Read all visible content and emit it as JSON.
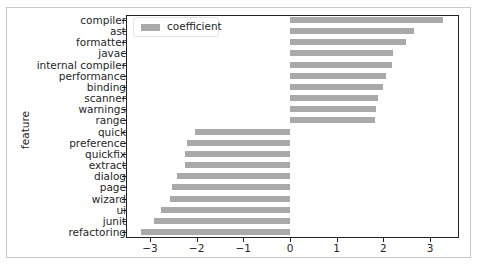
{
  "chart_data": {
    "type": "bar",
    "orientation": "horizontal",
    "title": "",
    "xlabel": "",
    "ylabel": "feature",
    "xlim": [
      -3.35,
      3.8
    ],
    "xticks": [
      -3,
      -2,
      -1,
      0,
      1,
      2,
      3
    ],
    "xtick_labels": [
      "−3",
      "−2",
      "−1",
      "0",
      "1",
      "2",
      "3"
    ],
    "grid": false,
    "legend": {
      "position": "upper left",
      "entries": [
        "coefficient"
      ]
    },
    "bar_color": "#a9a9a9",
    "categories": [
      "compiler",
      "ast",
      "formatter",
      "javac",
      "internal compiler",
      "performance",
      "binding",
      "scanner",
      "warnings",
      "range",
      "quick",
      "preference",
      "quickfix",
      "extract",
      "dialog",
      "page",
      "wizard",
      "ui",
      "junit",
      "refactoring"
    ],
    "series": [
      {
        "name": "coefficient",
        "values": [
          3.28,
          2.66,
          2.48,
          2.21,
          2.19,
          2.05,
          1.99,
          1.88,
          1.85,
          1.81,
          -2.03,
          -2.2,
          -2.24,
          -2.25,
          -2.41,
          -2.52,
          -2.58,
          -2.77,
          -2.91,
          -3.18
        ]
      }
    ]
  },
  "axes": {
    "ylabel": "feature"
  },
  "legend": {
    "label": "coefficient"
  }
}
